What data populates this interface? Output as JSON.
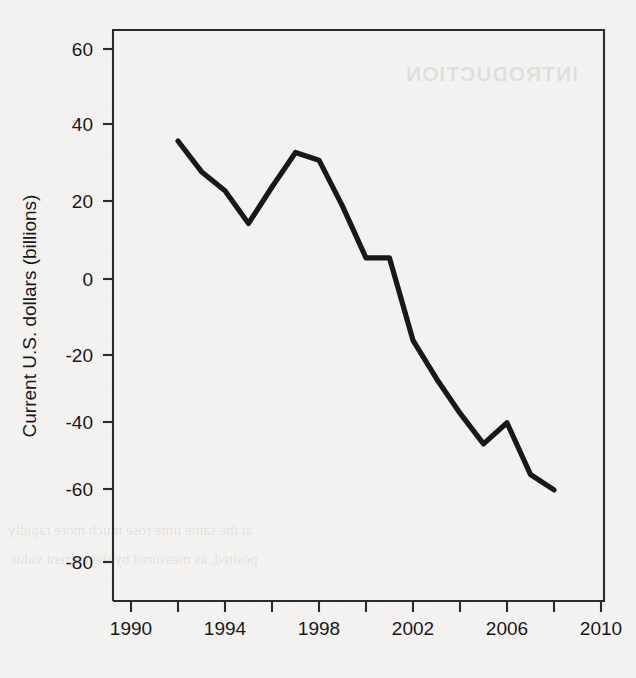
{
  "chart_data": {
    "type": "line",
    "title": "",
    "subtitle": "",
    "xlabel": "",
    "ylabel": "Current U.S. dollars (billions)",
    "xlim": [
      1989,
      2011
    ],
    "ylim": [
      -88,
      66
    ],
    "grid": false,
    "legend": null,
    "x_ticks": [
      1990,
      1992,
      1994,
      1996,
      1998,
      2000,
      2002,
      2004,
      2006,
      2008,
      2010
    ],
    "x_tick_labels": [
      "1990",
      "",
      "1994",
      "",
      "1998",
      "",
      "2002",
      "",
      "2006",
      "",
      "2010"
    ],
    "y_ticks": [
      60,
      40,
      20,
      0,
      -20,
      -40,
      -60,
      -80
    ],
    "y_tick_labels": [
      "60",
      "40",
      "20",
      "0",
      "-20",
      "-40",
      "-60",
      "-80"
    ],
    "series": [
      {
        "name": "Balance",
        "color": "#17181a",
        "x": [
          1992,
          1993,
          1994,
          1995,
          1996,
          1997,
          1998,
          1999,
          2000,
          2001,
          2002,
          2003,
          2004,
          2005,
          2006,
          2007,
          2008
        ],
        "values": [
          36,
          28,
          23,
          14.5,
          24,
          33,
          31,
          19,
          5.5,
          5.5,
          -16,
          -26,
          -35,
          -43,
          -37.5,
          -51,
          -55
        ]
      }
    ],
    "annotations": []
  },
  "axes": {
    "y_axis_title": "Current U.S. dollars (billions)"
  },
  "bleed_through": {
    "title": "INTRODUCTION",
    "line1": "at the same time rose much more rapidly",
    "line2": "posited, as measured by the current value"
  }
}
